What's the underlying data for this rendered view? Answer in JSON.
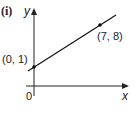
{
  "figure": {
    "label": "(i)",
    "x_axis_label": "x",
    "y_axis_label": "y",
    "origin_label": "0",
    "points": [
      {
        "label": "(0, 1)",
        "x": 0,
        "y": 1
      },
      {
        "label": "(7, 8)",
        "x": 7,
        "y": 8
      }
    ],
    "line_color": "#111111"
  }
}
